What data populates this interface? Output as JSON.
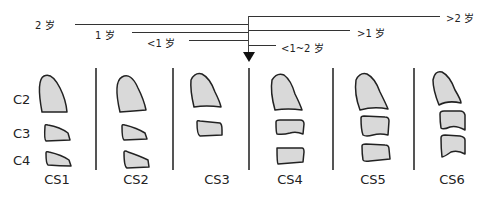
{
  "timeline": {
    "left_labels": [
      {
        "id": "age-2",
        "label": "2 岁"
      },
      {
        "id": "age-1",
        "label": "1 岁"
      },
      {
        "id": "age-lt1",
        "label": "<1 岁"
      }
    ],
    "right_labels": [
      {
        "id": "age-gt2",
        "label": ">2 岁"
      },
      {
        "id": "age-gt1",
        "label": ">1 岁"
      },
      {
        "id": "age-lt1-2",
        "label": "<1~2 岁"
      }
    ]
  },
  "vertebrae_labels": [
    "C2",
    "C3",
    "C4"
  ],
  "stages": [
    "CS1",
    "CS2",
    "CS3",
    "CS4",
    "CS5",
    "CS6"
  ],
  "colors": {
    "shape_fill": "#d9d9d9",
    "shape_stroke": "#222222",
    "line": "#333333"
  }
}
